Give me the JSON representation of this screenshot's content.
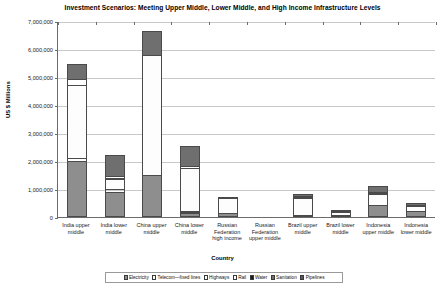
{
  "chart_data": {
    "type": "bar",
    "title": "Investment Scenarios: Meeting Upper Middle, Lower Middle, and High Income Infrastructure Levels",
    "xlabel": "Country",
    "ylabel": "US $ Millions",
    "ylim": [
      0,
      7000000
    ],
    "ytick_labels": [
      "7,000,000",
      "6,000,000",
      "5,000,000",
      "4,000,000",
      "3,000,000",
      "2,000,000",
      "1,000,000",
      "0"
    ],
    "ytick_values": [
      7000000,
      6000000,
      5000000,
      4000000,
      3000000,
      2000000,
      1000000,
      0
    ],
    "grid": true,
    "stacked": true,
    "legend_position": "bottom",
    "categories": [
      "India upper middle",
      "India lower middle",
      "China upper middle",
      "China lower middle",
      "Russian Federation high income",
      "Russian Federation upper middle",
      "Brazil upper middle",
      "Brazil lower middle",
      "Indonesia upper middle",
      "Indonesia lower middle"
    ],
    "series": [
      {
        "name": "Electricity",
        "color": "#8e8e8e",
        "values": [
          1990000,
          880000,
          1500000,
          140000,
          130000,
          0,
          60000,
          20000,
          420000,
          210000
        ]
      },
      {
        "name": "Telecom—fixed lines",
        "color": "#3b3b3b",
        "values": [
          130000,
          130000,
          0,
          40000,
          0,
          0,
          0,
          0,
          0,
          0
        ]
      },
      {
        "name": "Highways",
        "color": "#fdfdfd",
        "values": [
          2630000,
          400000,
          4300000,
          1570000,
          560000,
          0,
          620000,
          140000,
          440000,
          190000
        ]
      },
      {
        "name": "Rail",
        "color": "#ffffff",
        "values": [
          240000,
          110000,
          0,
          90000,
          0,
          0,
          0,
          0,
          0,
          0
        ]
      },
      {
        "name": "Water",
        "color": "#1c1c1c",
        "values": [
          0,
          0,
          0,
          0,
          0,
          0,
          60000,
          0,
          60000,
          40000
        ]
      },
      {
        "name": "Sanitation",
        "color": "#6f6f6f",
        "values": [
          560000,
          780000,
          900000,
          760000,
          60000,
          0,
          110000,
          40000,
          230000,
          110000
        ]
      },
      {
        "name": "Pipelines",
        "color": "#565656",
        "values": [
          0,
          0,
          0,
          0,
          0,
          0,
          0,
          0,
          0,
          0
        ]
      }
    ]
  },
  "legend": {
    "items": [
      {
        "label": "Electricity"
      },
      {
        "label": "Telecom—fixed lines"
      },
      {
        "label": "Highways"
      },
      {
        "label": "Rail"
      },
      {
        "label": "Water"
      },
      {
        "label": "Sanitation"
      },
      {
        "label": "Pipelines"
      }
    ]
  }
}
